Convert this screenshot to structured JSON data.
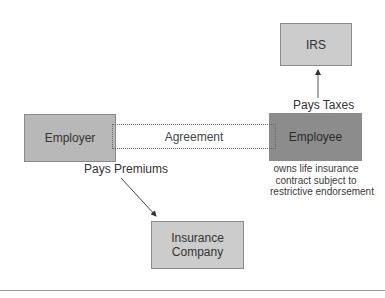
{
  "diagram": {
    "nodes": {
      "irs": {
        "label": "IRS",
        "color": "#cccccc"
      },
      "employer": {
        "label": "Employer",
        "color": "#b8b8b8"
      },
      "employee": {
        "label": "Employee",
        "color": "#8c8c8c"
      },
      "insurance": {
        "label_line1": "Insurance",
        "label_line2": "Company",
        "color": "#cccccc"
      }
    },
    "agreement": {
      "label": "Agreement"
    },
    "edges": {
      "pays_taxes": {
        "label": "Pays Taxes",
        "from": "Employee",
        "to": "IRS"
      },
      "pays_premiums": {
        "label": "Pays Premiums",
        "from": "Employer",
        "to": "Insurance Company"
      }
    },
    "employee_note": {
      "line1": "owns life insurance",
      "line2": "contract subject to",
      "line3": "restrictive endorsement"
    }
  }
}
